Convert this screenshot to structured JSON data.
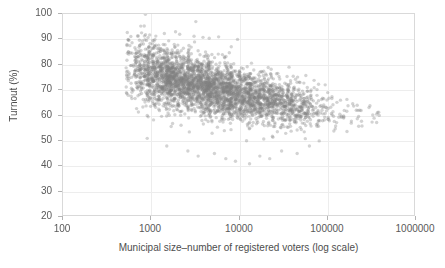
{
  "chart_data": {
    "type": "scatter",
    "title": "",
    "subtitle": "",
    "xlabel": "Municipal size–number of registered voters (log scale)",
    "ylabel": "Turnout (%)",
    "x_scale": "log",
    "y_scale": "linear",
    "xlim": [
      100,
      1000000
    ],
    "ylim": [
      20,
      100
    ],
    "x_ticks": [
      100,
      1000,
      10000,
      100000,
      1000000
    ],
    "x_tick_labels": [
      "100",
      "1000",
      "10000",
      "100000",
      "1000000"
    ],
    "y_ticks": [
      20,
      30,
      40,
      50,
      60,
      70,
      80,
      90,
      100
    ],
    "y_tick_labels": [
      "20",
      "30",
      "40",
      "50",
      "60",
      "70",
      "80",
      "90",
      "100"
    ],
    "grid": true,
    "grid_color": "#ededed",
    "legend": null,
    "legend_position": "none",
    "frame_color": "#d9d9d9",
    "background": "#ffffff",
    "marker": {
      "shape": "circle",
      "color": "#808080",
      "opacity": 0.35,
      "size_px": 3.4,
      "edge_color": "none"
    },
    "n_points_approx": 2600,
    "annotations": [],
    "series": [
      {
        "name": "municipalities",
        "color": "#808080",
        "trend": "decreasing",
        "x_range": [
          560,
          320000
        ],
        "y_range": [
          36,
          98
        ],
        "binned_summary": {
          "x_bin_centers": [
            700,
            1200,
            2000,
            3500,
            6000,
            10000,
            18000,
            32000,
            56000,
            100000,
            180000,
            300000
          ],
          "y_mean": [
            78.5,
            76.5,
            74.5,
            72.0,
            69.5,
            67.0,
            64.5,
            62.5,
            61.0,
            59.5,
            58.5,
            58.0
          ],
          "y_sd": [
            6.2,
            6.0,
            5.8,
            5.6,
            5.4,
            5.2,
            5.0,
            4.8,
            4.4,
            4.0,
            3.6,
            3.2
          ],
          "count": [
            160,
            330,
            430,
            430,
            380,
            300,
            230,
            150,
            90,
            55,
            25,
            12
          ]
        },
        "outliers_low": [
          {
            "x": 900,
            "y": 51
          },
          {
            "x": 1500,
            "y": 48
          },
          {
            "x": 2600,
            "y": 46
          },
          {
            "x": 3400,
            "y": 44
          },
          {
            "x": 5200,
            "y": 45
          },
          {
            "x": 7000,
            "y": 43
          },
          {
            "x": 9000,
            "y": 42
          },
          {
            "x": 13000,
            "y": 41
          },
          {
            "x": 17000,
            "y": 44
          },
          {
            "x": 22000,
            "y": 43
          },
          {
            "x": 30000,
            "y": 46
          },
          {
            "x": 45000,
            "y": 45
          },
          {
            "x": 62000,
            "y": 48
          },
          {
            "x": 80000,
            "y": 50
          }
        ],
        "outliers_high": [
          {
            "x": 3200,
            "y": 97
          },
          {
            "x": 1100,
            "y": 90
          },
          {
            "x": 2100,
            "y": 92
          },
          {
            "x": 5800,
            "y": 91
          },
          {
            "x": 9500,
            "y": 90
          },
          {
            "x": 1600,
            "y": 80
          },
          {
            "x": 1000,
            "y": 79
          },
          {
            "x": 1300,
            "y": 76
          },
          {
            "x": 900,
            "y": 60
          }
        ]
      }
    ]
  }
}
